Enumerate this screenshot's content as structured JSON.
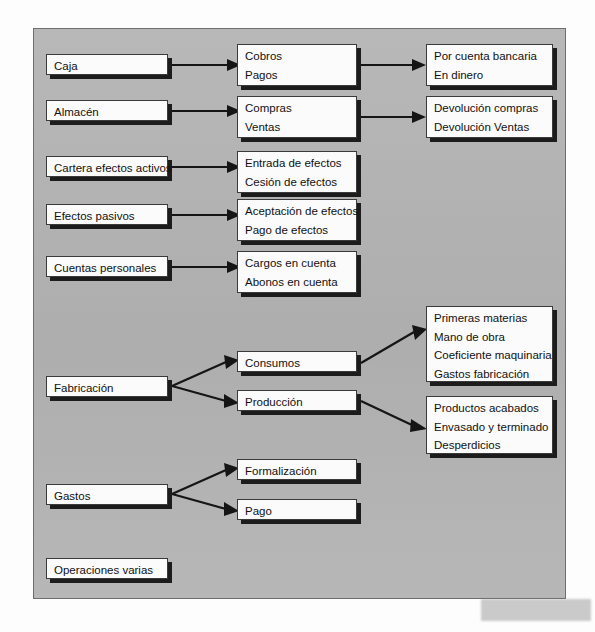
{
  "diagram": {
    "background_color": "#b4b4b4",
    "box_fill_color": "#fbfbfb",
    "box_border_color": "#3a3a3a",
    "shadow_color": "#1c1c1c",
    "watermark_text": "",
    "columns": {
      "level1_label": "Operación",
      "level2_label": "Subtipo",
      "level3_label": "Detalle"
    },
    "nodes": {
      "caja": {
        "lines": [
          "Caja"
        ]
      },
      "almacen": {
        "lines": [
          "Almacén"
        ]
      },
      "cartera": {
        "lines": [
          "Cartera efectos activos"
        ]
      },
      "efectos_pasivos": {
        "lines": [
          "Efectos pasivos"
        ]
      },
      "cuentas_personales": {
        "lines": [
          "Cuentas personales"
        ]
      },
      "fabricacion": {
        "lines": [
          "Fabricación"
        ]
      },
      "gastos": {
        "lines": [
          "Gastos"
        ]
      },
      "operaciones_varias": {
        "lines": [
          "Operaciones varias"
        ]
      },
      "cobros_pagos": {
        "lines": [
          "Cobros",
          "Pagos"
        ]
      },
      "compras_ventas": {
        "lines": [
          "Compras",
          "Ventas"
        ]
      },
      "entrada_cesion": {
        "lines": [
          "Entrada de efectos",
          "Cesión de efectos"
        ]
      },
      "aceptacion_pago": {
        "lines": [
          "Aceptación de efectos",
          "Pago de efectos"
        ]
      },
      "cargos_abonos": {
        "lines": [
          "Cargos en cuenta",
          "Abonos en cuenta"
        ]
      },
      "consumos": {
        "lines": [
          "Consumos"
        ]
      },
      "produccion": {
        "lines": [
          "Producción"
        ]
      },
      "formalizacion": {
        "lines": [
          "Formalización"
        ]
      },
      "pago": {
        "lines": [
          "Pago"
        ]
      },
      "bancaria_dinero": {
        "lines": [
          "Por cuenta bancaria",
          "En dinero"
        ]
      },
      "devoluciones": {
        "lines": [
          "Devolución compras",
          "Devolución Ventas"
        ]
      },
      "materias": {
        "lines": [
          "Primeras materias",
          "Mano de obra",
          "Coeficiente maquinaria",
          "Gastos fabricación"
        ]
      },
      "productos": {
        "lines": [
          "Productos acabados",
          "Envasado y terminado",
          "Desperdicios"
        ]
      }
    },
    "edges": [
      {
        "from": "caja",
        "to": "cobros_pagos"
      },
      {
        "from": "cobros_pagos",
        "to": "bancaria_dinero"
      },
      {
        "from": "almacen",
        "to": "compras_ventas"
      },
      {
        "from": "compras_ventas",
        "to": "devoluciones"
      },
      {
        "from": "cartera",
        "to": "entrada_cesion"
      },
      {
        "from": "efectos_pasivos",
        "to": "aceptacion_pago"
      },
      {
        "from": "cuentas_personales",
        "to": "cargos_abonos"
      },
      {
        "from": "fabricacion",
        "to": "consumos"
      },
      {
        "from": "fabricacion",
        "to": "produccion"
      },
      {
        "from": "consumos",
        "to": "materias"
      },
      {
        "from": "produccion",
        "to": "productos"
      },
      {
        "from": "gastos",
        "to": "formalizacion"
      },
      {
        "from": "gastos",
        "to": "pago"
      }
    ]
  }
}
